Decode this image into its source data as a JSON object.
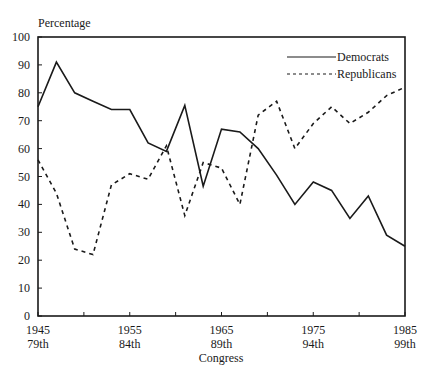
{
  "chart_data": {
    "type": "line",
    "title": "",
    "ylabel": "Percentage",
    "xlabel": "Congress",
    "ylim": [
      0,
      100
    ],
    "xlim": [
      1945,
      1985
    ],
    "yticks": [
      0,
      10,
      20,
      30,
      40,
      50,
      60,
      70,
      80,
      90,
      100
    ],
    "xtick_labels": [
      {
        "year": 1945,
        "year_label": "1945",
        "congress_label": "79th"
      },
      {
        "year": 1955,
        "year_label": "1955",
        "congress_label": "84th"
      },
      {
        "year": 1965,
        "year_label": "1965",
        "congress_label": "89th"
      },
      {
        "year": 1975,
        "year_label": "1975",
        "congress_label": "94th"
      },
      {
        "year": 1985,
        "year_label": "1985",
        "congress_label": "99th"
      }
    ],
    "minor_tick_years": [
      1950,
      1960,
      1970,
      1980
    ],
    "x": [
      1945,
      1947,
      1949,
      1951,
      1953,
      1955,
      1957,
      1959,
      1961,
      1963,
      1965,
      1967,
      1969,
      1971,
      1973,
      1975,
      1977,
      1979,
      1981,
      1983,
      1985
    ],
    "series": [
      {
        "name": "Democrats",
        "style": "solid",
        "values": [
          75,
          91,
          80,
          77,
          74,
          74,
          62,
          59,
          75.5,
          46.5,
          67,
          66,
          60,
          50.5,
          40,
          48,
          45,
          35,
          43,
          29,
          25
        ]
      },
      {
        "name": "Republicans",
        "style": "dashed",
        "values": [
          56,
          44,
          24,
          22,
          47,
          51,
          49,
          61,
          36,
          55,
          53,
          40,
          72,
          77,
          60,
          69,
          75,
          69,
          73,
          79,
          82
        ]
      }
    ],
    "legend": {
      "position": "upper right",
      "entries": [
        "Democrats",
        "Republicans"
      ]
    },
    "grid": false
  }
}
